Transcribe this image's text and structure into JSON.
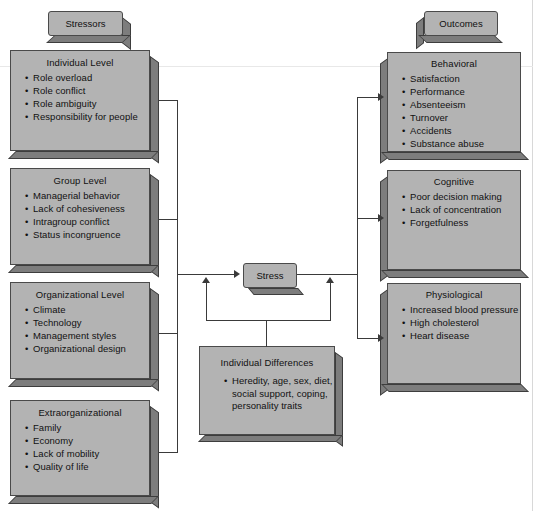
{
  "diagram": {
    "colors": {
      "box_fill": "#b3b3b3",
      "box_border": "#4a4a4a",
      "box_shadow": "#7d7d7d",
      "connector": "#3a3a3a",
      "page_background": "#ffffff",
      "text": "#111111"
    }
  },
  "headers": {
    "stressors": "Stressors",
    "outcomes": "Outcomes"
  },
  "stressors": [
    {
      "key": "individual-level",
      "title": "Individual Level",
      "items": [
        "Role overload",
        "Role conflict",
        "Role ambiguity",
        "Responsibility for people"
      ]
    },
    {
      "key": "group-level",
      "title": "Group Level",
      "items": [
        "Managerial behavior",
        "Lack of cohesiveness",
        "Intragroup conflict",
        "Status incongruence"
      ]
    },
    {
      "key": "organizational-level",
      "title": "Organizational Level",
      "items": [
        "Climate",
        "Technology",
        "Management styles",
        "Organizational design"
      ]
    },
    {
      "key": "extraorganizational",
      "title": "Extraorganizational",
      "items": [
        "Family",
        "Economy",
        "Lack of mobility",
        "Quality of life"
      ]
    }
  ],
  "center": {
    "stress_label": "Stress",
    "moderator": {
      "key": "individual-differences",
      "title": "Individual Differences",
      "items": [
        "Heredity, age, sex, diet, social support, coping, personality traits"
      ]
    }
  },
  "outcomes": [
    {
      "key": "behavioral",
      "title": "Behavioral",
      "items": [
        "Satisfaction",
        "Performance",
        "Absenteeism",
        "Turnover",
        "Accidents",
        "Substance abuse"
      ]
    },
    {
      "key": "cognitive",
      "title": "Cognitive",
      "items": [
        "Poor decision making",
        "Lack of concentration",
        "Forgetfulness"
      ]
    },
    {
      "key": "physiological",
      "title": "Physiological",
      "items": [
        "Increased blood pressure",
        "High cholesterol",
        "Heart disease"
      ]
    }
  ]
}
